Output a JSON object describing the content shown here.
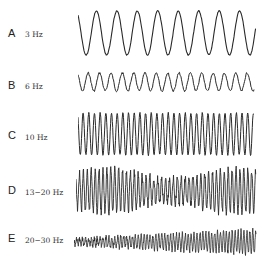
{
  "figure": {
    "rows": [
      {
        "letter": "A",
        "frequency": "3 Hz"
      },
      {
        "letter": "B",
        "frequency": "6 Hz"
      },
      {
        "letter": "C",
        "frequency": "10 Hz"
      },
      {
        "letter": "D",
        "frequency": "13−20 Hz"
      },
      {
        "letter": "E",
        "frequency": "20−30 Hz"
      }
    ]
  }
}
